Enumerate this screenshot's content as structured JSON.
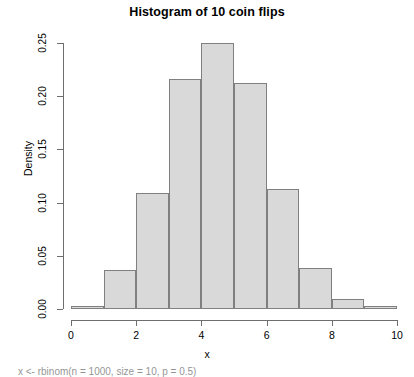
{
  "chart_data": {
    "type": "bar",
    "title": "Histogram of 10 coin flips",
    "xlabel": "x",
    "ylabel": "Density",
    "xlim": [
      0,
      10
    ],
    "ylim": [
      0,
      0.25
    ],
    "grid": false,
    "legend": null,
    "bin_width": 1,
    "bin_edges": [
      0,
      1,
      2,
      3,
      4,
      5,
      6,
      7,
      8,
      9,
      10
    ],
    "categories": [
      "0-1",
      "1-2",
      "2-3",
      "3-4",
      "4-5",
      "5-6",
      "6-7",
      "7-8",
      "8-9",
      "9-10"
    ],
    "values": [
      0.003,
      0.037,
      0.109,
      0.216,
      0.25,
      0.212,
      0.113,
      0.039,
      0.009,
      0.003
    ],
    "xticks": [
      0,
      2,
      4,
      6,
      8,
      10
    ],
    "xtick_labels": [
      "0",
      "2",
      "4",
      "6",
      "8",
      "10"
    ],
    "yticks": [
      0.0,
      0.05,
      0.1,
      0.15,
      0.2,
      0.25
    ],
    "ytick_labels": [
      "0.00",
      "0.05",
      "0.10",
      "0.15",
      "0.20",
      "0.25"
    ],
    "bar_fill_color": "#d9d9d9",
    "bar_border_color": "#808080",
    "axis_color": "#6e6e6e",
    "background_color": "#ffffff"
  },
  "caption": {
    "text": "x <- rbinom(n = 1000, size = 10, p = 0.5)"
  }
}
